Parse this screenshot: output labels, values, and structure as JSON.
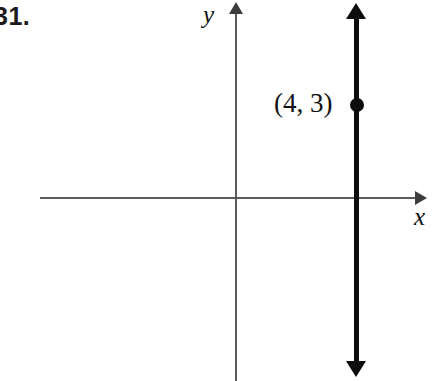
{
  "figure": {
    "problem_number": "31.",
    "background_color": "#ffffff",
    "axis_color": "#5a5a5a",
    "plot_color": "#0d0d0d",
    "text_color": "#111111"
  },
  "axes": {
    "x_label": "x",
    "y_label": "y",
    "origin": {
      "x": 236,
      "y": 198
    },
    "x_arrow": "right-arrowhead",
    "y_arrow": "up-arrowhead"
  },
  "chart_data": {
    "type": "line",
    "title": "",
    "subtitle": "",
    "xlabel": "x",
    "ylabel": "y",
    "grid": false,
    "legend": "none",
    "xlim": [
      -6,
      6
    ],
    "ylim": [
      -6,
      6
    ],
    "series": [
      {
        "name": "x = 4",
        "equation": "x = 4",
        "orientation": "vertical",
        "x": [
          4,
          4
        ],
        "y": [
          -7,
          7
        ],
        "arrows": [
          "up",
          "down"
        ],
        "color": "#0d0d0d",
        "line_width": 5
      }
    ],
    "points": [
      {
        "label": "(4, 3)",
        "x": 4,
        "y": 3,
        "marker": "filled-circle",
        "label_position": "left"
      }
    ],
    "annotations": [
      {
        "text": "31.",
        "role": "problem-number",
        "position": "top-left"
      }
    ]
  }
}
